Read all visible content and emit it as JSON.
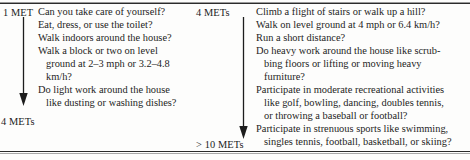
{
  "figure": {
    "type": "met-activity-scale",
    "left_scale": {
      "top_label": "1 MET",
      "bottom_label": "4 METs",
      "arrow": "down-arrow"
    },
    "right_scale": {
      "top_label": "4 METs",
      "bottom_label": "> 10 METs",
      "arrow": "down-arrow"
    },
    "left_column": {
      "lines": [
        {
          "text": "Can you take care of yourself?",
          "indent": false
        },
        {
          "text": "Eat, dress, or use the toilet?",
          "indent": false
        },
        {
          "text": "Walk indoors around the house?",
          "indent": false
        },
        {
          "text": "Walk a block or two on level",
          "indent": false
        },
        {
          "text": "ground at 2–3 mph or 3.2–4.8",
          "indent": true
        },
        {
          "text": "km/h?",
          "indent": true
        },
        {
          "text": "Do light work around the house",
          "indent": false
        },
        {
          "text": "like dusting or washing dishes?",
          "indent": true
        }
      ]
    },
    "right_column": {
      "lines": [
        {
          "text": "Climb a flight of stairs or walk up a hill?",
          "indent": false
        },
        {
          "text": "Walk on level ground at 4 mph or 6.4 km/h?",
          "indent": false
        },
        {
          "text": "Run a short distance?",
          "indent": false
        },
        {
          "text": "Do heavy work around the house like scrub-",
          "indent": false
        },
        {
          "text": "bing floors or lifting or moving heavy",
          "indent": true
        },
        {
          "text": "furniture?",
          "indent": true
        },
        {
          "text": "Participate in moderate recreational activities",
          "indent": false
        },
        {
          "text": "like golf, bowling, dancing, doubles tennis,",
          "indent": true
        },
        {
          "text": "or throwing a baseball or football?",
          "indent": true
        },
        {
          "text": "Participate in strenuous sports like swimming,",
          "indent": false
        },
        {
          "text": "singles tennis, football, basketball, or skiing?",
          "indent": true
        }
      ]
    },
    "colors": {
      "text": "#1d1d1d",
      "rule": "#2b2b2b",
      "background": "#fdfdfc"
    }
  }
}
